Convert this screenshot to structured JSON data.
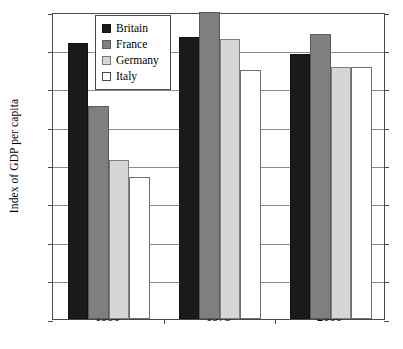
{
  "chart_data": {
    "type": "bar",
    "title": "",
    "subtitle": "",
    "xlabel": "",
    "ylabel": "Index of GDP per capita",
    "categories": [
      "1950",
      "1973",
      "2000"
    ],
    "ylim": [
      0,
      80
    ],
    "yticks": [
      0,
      10,
      20,
      30,
      40,
      50,
      60,
      70,
      80
    ],
    "ytick_labels": [
      "0",
      "10",
      "20",
      "30",
      "40",
      "50",
      "60",
      "70",
      "80"
    ],
    "grid": true,
    "legend_position": "top-left-inside",
    "series": [
      {
        "name": "Britain",
        "color": "#1a1a1a",
        "values": [
          72,
          73.5,
          69
        ]
      },
      {
        "name": "France",
        "color": "#7f7f7f",
        "values": [
          55.5,
          80,
          74.2
        ]
      },
      {
        "name": "Germany",
        "color": "#d6d6d6",
        "values": [
          41.5,
          73,
          65.8
        ]
      },
      {
        "name": "Italy",
        "color": "#ffffff",
        "values": [
          37,
          65,
          65.8
        ]
      }
    ]
  },
  "legend": {
    "items": [
      {
        "label": "Britain"
      },
      {
        "label": "France"
      },
      {
        "label": "Germany"
      },
      {
        "label": "Italy"
      }
    ]
  }
}
